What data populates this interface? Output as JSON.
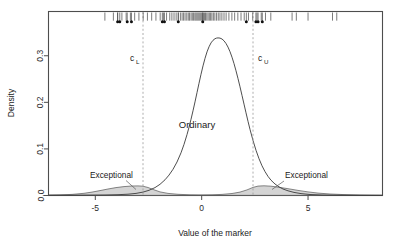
{
  "chart_data": {
    "type": "area",
    "title": "",
    "xlabel": "Value of the marker",
    "ylabel": "Density",
    "xlim": [
      -7.2,
      8.5
    ],
    "ylim": [
      0.0,
      0.395
    ],
    "grid": false,
    "legend_position": "none",
    "x_ticks": [
      -5,
      0,
      5
    ],
    "x_tick_labels": [
      "-5",
      "0",
      "5"
    ],
    "y_ticks": [
      0.0,
      0.1,
      0.2,
      0.3
    ],
    "y_tick_labels": [
      "0.0",
      "0.1",
      "0.2",
      "0.3"
    ],
    "series": [
      {
        "name": "Ordinary",
        "kind": "density",
        "distribution": "normal",
        "mean": 0,
        "sd": 1.06,
        "peak_density": 0.377,
        "curve_color": "#3a3a3a",
        "label": "Ordinary",
        "label_x": 0,
        "label_y": 0.145
      },
      {
        "name": "Exceptional",
        "kind": "density",
        "distribution": "bimodal-normal-mixture",
        "modes": [
          -3.1,
          3.4
        ],
        "sd": 1.5,
        "peak_density": 0.013,
        "fill_color": "#b0b0b0",
        "curve_color": "#555555",
        "labels": [
          "Exceptional",
          "Exceptional"
        ],
        "label_left_x": -4.0,
        "label_right_x": 4.6,
        "label_y": 0.028
      }
    ],
    "cutoffs": [
      {
        "name": "c_L",
        "label_main": "c",
        "label_sub": "L",
        "value": -2.45,
        "style": "dashed",
        "color": "#9a9a9a"
      },
      {
        "name": "c_U",
        "label_main": "c",
        "label_sub": "U",
        "value": 2.55,
        "style": "dashed",
        "color": "#9a9a9a"
      }
    ],
    "rug": {
      "description": "observed marker values drawn as tick marks along the top of the panel",
      "y_position": 0.385,
      "tick_values": [
        -4.55,
        -4.15,
        -3.95,
        -3.75,
        -3.55,
        -3.35,
        -3.15,
        -2.95,
        -2.75,
        -2.55,
        -2.35,
        -2.15,
        -1.95,
        -1.8,
        -1.65,
        -1.5,
        -1.4,
        -1.3,
        -1.2,
        -1.1,
        -1.0,
        -0.92,
        -0.85,
        -0.78,
        -0.7,
        -0.63,
        -0.57,
        -0.5,
        -0.44,
        -0.38,
        -0.32,
        -0.27,
        -0.22,
        -0.17,
        -0.12,
        -0.07,
        -0.02,
        0.03,
        0.08,
        0.13,
        0.18,
        0.24,
        0.3,
        0.36,
        0.42,
        0.48,
        0.55,
        0.62,
        0.7,
        0.78,
        0.86,
        0.95,
        1.05,
        1.15,
        1.28,
        1.42,
        1.55,
        1.7,
        1.85,
        2.0,
        2.2,
        2.4,
        2.6,
        2.8,
        3.0,
        3.25,
        4.25,
        4.45,
        5.0,
        6.15,
        6.35
      ],
      "point_values": [
        -3.95,
        -3.85,
        -3.5,
        -3.3,
        -1.85,
        -1.75,
        -1.1,
        0.05,
        2.1,
        2.55,
        2.65,
        2.85
      ]
    }
  }
}
